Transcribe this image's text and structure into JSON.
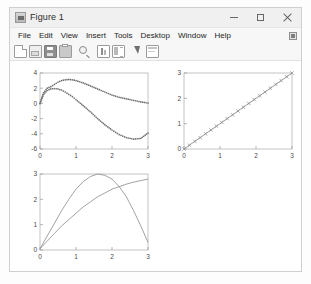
{
  "window": {
    "title": "Figure 1",
    "icon": "matlab-figure-icon",
    "controls": {
      "minimize": "—",
      "maximize": "□",
      "close": "✕"
    }
  },
  "menubar": {
    "items": [
      {
        "label": "File"
      },
      {
        "label": "Edit"
      },
      {
        "label": "View"
      },
      {
        "label": "Insert"
      },
      {
        "label": "Tools"
      },
      {
        "label": "Desktop"
      },
      {
        "label": "Window"
      },
      {
        "label": "Help"
      }
    ],
    "dock_icon": "dock-figure-icon"
  },
  "toolbar": {
    "buttons": [
      {
        "name": "new-figure-icon"
      },
      {
        "name": "open-file-icon"
      },
      {
        "name": "save-figure-icon"
      },
      {
        "name": "print-figure-icon"
      },
      {
        "name": "zoom-in-icon"
      },
      {
        "name": "data-cursor-icon"
      },
      {
        "name": "colorbar-icon"
      },
      {
        "name": "edit-plot-pointer-icon"
      },
      {
        "name": "insert-legend-icon"
      }
    ]
  },
  "chart_data": [
    {
      "id": "top-left",
      "type": "line",
      "title": "",
      "xlabel": "",
      "ylabel": "",
      "xlim": [
        0,
        3
      ],
      "ylim": [
        -6,
        4
      ],
      "xticks": [
        0,
        1,
        2,
        3
      ],
      "yticks": [
        4,
        2,
        0,
        -2,
        -4,
        -6
      ],
      "grid": false,
      "legend": "none",
      "series": [
        {
          "name": "series-a",
          "linestyle": "dotted",
          "marker": "dot",
          "color": "#707070",
          "x": [
            0.0,
            0.1,
            0.2,
            0.3,
            0.4,
            0.5,
            0.6,
            0.7,
            0.8,
            0.9,
            1.0,
            1.2,
            1.4,
            1.6,
            1.8,
            2.0,
            2.2,
            2.4,
            2.6,
            2.8,
            3.0
          ],
          "y": [
            0.0,
            1.4,
            2.0,
            2.2,
            2.5,
            2.8,
            3.0,
            3.1,
            3.15,
            3.1,
            3.0,
            2.7,
            2.3,
            1.9,
            1.5,
            1.1,
            0.8,
            0.6,
            0.4,
            0.2,
            0.05
          ]
        },
        {
          "name": "series-b",
          "linestyle": "dotted",
          "marker": "dot",
          "color": "#707070",
          "x": [
            0.0,
            0.1,
            0.2,
            0.3,
            0.4,
            0.5,
            0.6,
            0.7,
            0.8,
            0.9,
            1.0,
            1.2,
            1.4,
            1.6,
            1.8,
            2.0,
            2.2,
            2.4,
            2.6,
            2.8,
            3.0
          ],
          "y": [
            0.0,
            1.2,
            1.7,
            1.9,
            1.95,
            1.9,
            1.75,
            1.5,
            1.2,
            0.9,
            0.5,
            -0.3,
            -1.1,
            -2.0,
            -2.8,
            -3.5,
            -4.1,
            -4.5,
            -4.7,
            -4.6,
            -3.9
          ]
        }
      ]
    },
    {
      "id": "top-right",
      "type": "line",
      "title": "",
      "xlabel": "",
      "ylabel": "",
      "xlim": [
        0,
        3
      ],
      "ylim": [
        0,
        3
      ],
      "xticks": [
        0,
        1,
        2,
        3
      ],
      "yticks": [
        0,
        1,
        2,
        3
      ],
      "grid": false,
      "legend": "none",
      "series": [
        {
          "name": "identity-line",
          "linestyle": "solid",
          "marker": "x",
          "color": "#8a8a8a",
          "x": [
            0,
            0.15,
            0.3,
            0.45,
            0.6,
            0.75,
            0.9,
            1.05,
            1.2,
            1.35,
            1.5,
            1.65,
            1.8,
            1.95,
            2.1,
            2.25,
            2.4,
            2.55,
            2.7,
            2.85,
            3.0
          ],
          "y": [
            0,
            0.15,
            0.3,
            0.45,
            0.6,
            0.75,
            0.9,
            1.05,
            1.2,
            1.35,
            1.5,
            1.65,
            1.8,
            1.95,
            2.1,
            2.25,
            2.4,
            2.55,
            2.7,
            2.85,
            3.0
          ]
        }
      ]
    },
    {
      "id": "bottom-left",
      "type": "line",
      "title": "",
      "xlabel": "",
      "ylabel": "",
      "xlim": [
        0,
        3
      ],
      "ylim": [
        0,
        3
      ],
      "xticks": [
        0,
        1,
        2,
        3
      ],
      "yticks": [
        0,
        1,
        2,
        3
      ],
      "grid": false,
      "legend": "none",
      "series": [
        {
          "name": "arch-curve",
          "linestyle": "solid",
          "marker": "none",
          "color": "#8a8a8a",
          "x": [
            0,
            0.2,
            0.4,
            0.6,
            0.8,
            1.0,
            1.2,
            1.4,
            1.6,
            1.8,
            2.0,
            2.2,
            2.4,
            2.6,
            2.8,
            3.0
          ],
          "y": [
            0.05,
            0.55,
            1.05,
            1.55,
            2.0,
            2.4,
            2.7,
            2.9,
            3.0,
            2.95,
            2.8,
            2.5,
            2.1,
            1.55,
            0.95,
            0.3
          ]
        },
        {
          "name": "rising-curve",
          "linestyle": "solid",
          "marker": "none",
          "color": "#8a8a8a",
          "x": [
            0,
            0.2,
            0.4,
            0.6,
            0.8,
            1.0,
            1.2,
            1.4,
            1.6,
            1.8,
            2.0,
            2.2,
            2.4,
            2.6,
            2.8,
            3.0
          ],
          "y": [
            0.05,
            0.35,
            0.65,
            0.95,
            1.2,
            1.45,
            1.7,
            1.9,
            2.1,
            2.25,
            2.4,
            2.5,
            2.6,
            2.68,
            2.74,
            2.8
          ]
        }
      ]
    }
  ]
}
